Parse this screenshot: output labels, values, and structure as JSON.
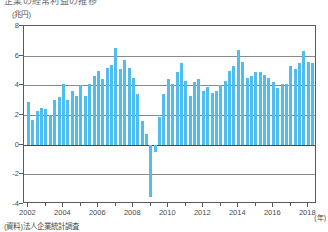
{
  "title_strip": "企業の経常利益の推移",
  "unit_label": "(兆円)",
  "x_unit_label": "(年)",
  "source_note": "(資料)法人企業統計調査",
  "colors": {
    "bar": "#4fbdee",
    "axis": "#5a5a5a",
    "grid": "#8a8a8a",
    "zero": "#4a4a4a",
    "text": "#4a4a4a",
    "background": "#ffffff"
  },
  "chart_data": {
    "type": "bar",
    "title": "企業の経常利益の推移",
    "xlabel": "(年)",
    "ylabel": "(兆円)",
    "ylim": [
      -4,
      8
    ],
    "yticks": [
      8,
      6,
      4,
      2,
      0,
      -2,
      -4
    ],
    "ytick_labels": [
      "8",
      "6",
      "4",
      "2",
      "0",
      "-2",
      "-4"
    ],
    "xlim": [
      2001.75,
      2018.5
    ],
    "xticks": [
      2002,
      2004,
      2006,
      2008,
      2010,
      2012,
      2014,
      2016,
      2018
    ],
    "xtick_labels": [
      "2002",
      "2004",
      "2006",
      "2008",
      "2010",
      "2012",
      "2014",
      "2016",
      "2018"
    ],
    "grid": true,
    "legend": "none",
    "series_name": "経常利益",
    "frequency": "quarterly",
    "x": [
      2002.0,
      2002.25,
      2002.5,
      2002.75,
      2003.0,
      2003.25,
      2003.5,
      2003.75,
      2004.0,
      2004.25,
      2004.5,
      2004.75,
      2005.0,
      2005.25,
      2005.5,
      2005.75,
      2006.0,
      2006.25,
      2006.5,
      2006.75,
      2007.0,
      2007.25,
      2007.5,
      2007.75,
      2008.0,
      2008.25,
      2008.5,
      2008.75,
      2009.0,
      2009.25,
      2009.5,
      2009.75,
      2010.0,
      2010.25,
      2010.5,
      2010.75,
      2011.0,
      2011.25,
      2011.5,
      2011.75,
      2012.0,
      2012.25,
      2012.5,
      2012.75,
      2013.0,
      2013.25,
      2013.5,
      2013.75,
      2014.0,
      2014.25,
      2014.5,
      2014.75,
      2015.0,
      2015.25,
      2015.5,
      2015.75,
      2016.0,
      2016.25,
      2016.5,
      2016.75,
      2017.0,
      2017.25,
      2017.5,
      2017.75,
      2018.0,
      2018.25
    ],
    "values": [
      2.9,
      1.7,
      2.3,
      2.5,
      2.4,
      2.0,
      3.0,
      3.2,
      4.1,
      3.0,
      3.6,
      3.3,
      4.0,
      3.3,
      4.1,
      4.6,
      5.0,
      4.4,
      5.2,
      5.4,
      6.5,
      5.1,
      5.7,
      5.2,
      4.5,
      3.4,
      1.6,
      0.7,
      -3.5,
      -0.5,
      1.9,
      3.4,
      4.4,
      4.1,
      4.9,
      5.5,
      4.3,
      3.3,
      4.2,
      4.4,
      3.6,
      3.9,
      3.5,
      3.6,
      4.0,
      4.3,
      5.0,
      5.3,
      6.4,
      5.6,
      4.5,
      4.6,
      4.9,
      4.9,
      4.7,
      4.5,
      4.2,
      3.8,
      4.1,
      4.1,
      5.3,
      5.1,
      5.5,
      6.3,
      5.6,
      5.5
    ]
  }
}
